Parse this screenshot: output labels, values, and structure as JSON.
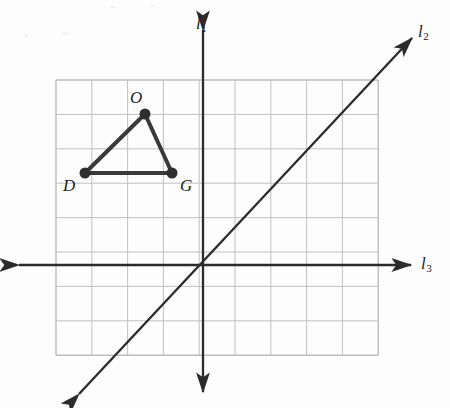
{
  "figure": {
    "background_color": "#fdfdfd",
    "grid": {
      "cols": 9,
      "rows": 8,
      "left": 56,
      "top": 80,
      "cell_width": 35.8,
      "cell_height": 34.4,
      "line_color": "#c0c0c0",
      "border_color": "#bdbdbd"
    },
    "lines": [
      {
        "id": "l1",
        "label": "l",
        "subscript": "1",
        "kind": "vertical-axis",
        "color": "#2b2b2b",
        "x1": 203,
        "y1": 30,
        "x2": 203,
        "y2": 392,
        "arrows": "both",
        "label_x": 196,
        "label_y": 14
      },
      {
        "id": "l2",
        "label": "l",
        "subscript": "2",
        "kind": "diagonal",
        "color": "#2b2b2b",
        "x1": 79,
        "y1": 394,
        "x2": 412,
        "y2": 38,
        "arrows": "both",
        "label_x": 418,
        "label_y": 22
      },
      {
        "id": "l3",
        "label": "l",
        "subscript": "3",
        "kind": "horizontal-axis",
        "color": "#2b2b2b",
        "x1": 19,
        "y1": 265,
        "x2": 411,
        "y2": 265,
        "arrows": "both",
        "label_x": 421,
        "label_y": 254
      }
    ],
    "triangle": {
      "name": "DOG",
      "stroke_color": "#3a3a3a",
      "stroke_width": 4,
      "vertex_color": "#2e2e2e",
      "vertex_radius": 5.5,
      "vertices": [
        {
          "name": "O",
          "x": 145,
          "y": 114,
          "label_x": 130,
          "label_y": 88
        },
        {
          "name": "D",
          "x": 85,
          "y": 173,
          "label_x": 63,
          "label_y": 176
        },
        {
          "name": "G",
          "x": 172,
          "y": 173,
          "label_x": 180,
          "label_y": 176
        }
      ]
    },
    "origin": {
      "x": 203,
      "y": 265
    }
  }
}
